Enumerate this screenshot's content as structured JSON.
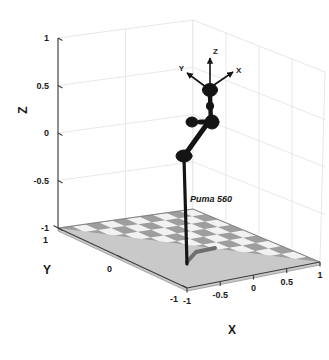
{
  "figure": {
    "background_color": "#ffffff",
    "robot_color": "#141414",
    "grid_color": "#d8d8d8",
    "axis_color": "#3c3c3c",
    "floor_light": "#f0f0f0",
    "floor_dark": "#9a9a9a"
  },
  "chart_data": {
    "type": "scatter",
    "title": "",
    "subtitle": "",
    "xlabel": "X",
    "ylabel": "Y",
    "zlabel": "Z",
    "xlim": [
      -1,
      1
    ],
    "ylim": [
      -1,
      1
    ],
    "zlim": [
      -1,
      1
    ],
    "xticks": [
      -1,
      -0.5,
      0,
      0.5,
      1
    ],
    "xtick_labels": [
      "-1",
      "-0.5",
      "0",
      "0.5",
      "1"
    ],
    "yticks": [
      1,
      0,
      -1
    ],
    "ytick_labels": [
      "1",
      "0",
      "-1"
    ],
    "zticks": [
      1,
      0.5,
      0,
      -0.5,
      -1
    ],
    "ztick_labels": [
      "1",
      "0.5",
      "0",
      "-0.5",
      "-1"
    ],
    "grid": true,
    "legend": "none",
    "projection": "3d",
    "annotations": [
      {
        "text": "Puma 560",
        "x": -0.5,
        "y": 0,
        "z": -0.75
      },
      {
        "text": "X",
        "role": "end-effector-frame-x-axis"
      },
      {
        "text": "Y",
        "role": "end-effector-frame-y-axis"
      },
      {
        "text": "Z",
        "role": "end-effector-frame-z-axis"
      }
    ],
    "series": [
      {
        "name": "Puma 560 manipulator",
        "type": "line",
        "joints": [
          {
            "name": "base",
            "px": 187,
            "py": 262
          },
          {
            "name": "shoulder",
            "px": 183,
            "py": 156
          },
          {
            "name": "elbow",
            "px": 208,
            "py": 122
          },
          {
            "name": "wrist-1",
            "px": 212,
            "py": 120
          },
          {
            "name": "wrist-2",
            "px": 210,
            "py": 91
          },
          {
            "name": "tool",
            "px": 210,
            "py": 88
          }
        ]
      }
    ]
  },
  "axes": {
    "x_axis": {
      "label": "X",
      "ticks": [
        "-1",
        "-0.5",
        "0",
        "0.5",
        "1"
      ]
    },
    "y_axis": {
      "label": "Y",
      "ticks": [
        "1",
        "0",
        "-1"
      ]
    },
    "z_axis": {
      "label": "Z",
      "ticks": [
        "1",
        "0.5",
        "0",
        "-0.5",
        "-1"
      ]
    }
  },
  "robot": {
    "name_label": "Puma 560",
    "end_effector_frame": {
      "x_label": "X",
      "y_label": "Y",
      "z_label": "Z"
    }
  }
}
